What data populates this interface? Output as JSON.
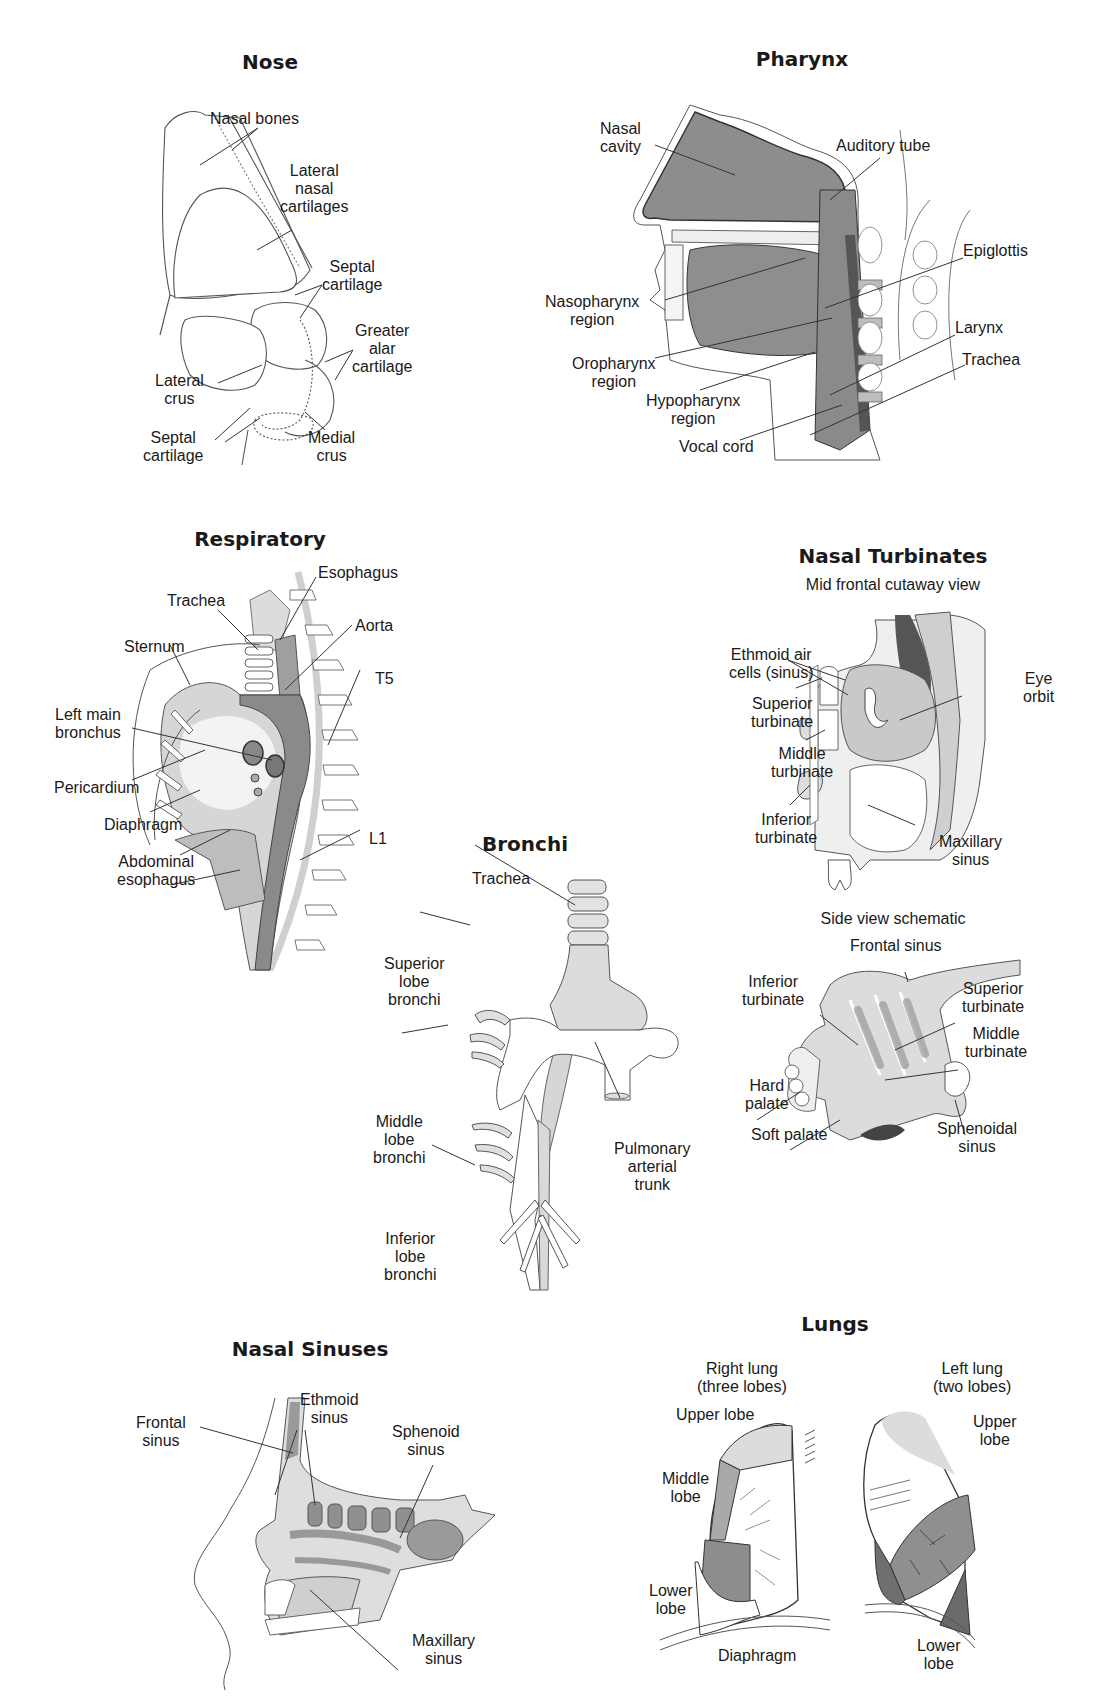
{
  "page": {
    "background": "#ffffff",
    "ink_color": "#1a1a1a",
    "tone_light": "#d8d8d8",
    "tone_mid": "#a9a9a9",
    "tone_dark": "#6f6f6f"
  },
  "panels": {
    "nose": {
      "title": "Nose",
      "labels": [
        {
          "text": "Nasal bones"
        },
        {
          "text": "Lateral\nnasal\ncartilages"
        },
        {
          "text": "Septal\ncartilage"
        },
        {
          "text": "Greater\nalar\ncartilage"
        },
        {
          "text": "Lateral\ncrus"
        },
        {
          "text": "Septal\ncartilage"
        },
        {
          "text": "Medial\ncrus"
        }
      ]
    },
    "pharynx": {
      "title": "Pharynx",
      "labels": [
        {
          "text": "Nasal\ncavity"
        },
        {
          "text": "Auditory tube"
        },
        {
          "text": "Epiglottis"
        },
        {
          "text": "Nasopharynx\nregion"
        },
        {
          "text": "Larynx"
        },
        {
          "text": "Oropharynx\nregion"
        },
        {
          "text": "Trachea"
        },
        {
          "text": "Hypopharynx\nregion"
        },
        {
          "text": "Vocal cord"
        }
      ]
    },
    "respiratory": {
      "title": "Respiratory",
      "labels": [
        {
          "text": "Esophagus"
        },
        {
          "text": "Trachea"
        },
        {
          "text": "Aorta"
        },
        {
          "text": "Sternum"
        },
        {
          "text": "T5"
        },
        {
          "text": "Left main\nbronchus"
        },
        {
          "text": "Pericardium"
        },
        {
          "text": "Diaphragm"
        },
        {
          "text": "Abdominal\nesophagus"
        },
        {
          "text": "L1"
        }
      ]
    },
    "nasal_turbinates": {
      "title": "Nasal Turbinates",
      "front_view": {
        "subtitle": "Mid frontal cutaway view",
        "labels": [
          {
            "text": "Ethmoid air\ncells (sinus)"
          },
          {
            "text": "Eye\norbit"
          },
          {
            "text": "Superior\nturbinate"
          },
          {
            "text": "Middle\nturbinate"
          },
          {
            "text": "Inferior\nturbinate"
          },
          {
            "text": "Maxillary\nsinus"
          }
        ]
      },
      "side_view": {
        "subtitle": "Side view schematic",
        "labels": [
          {
            "text": "Frontal sinus"
          },
          {
            "text": "Inferior\nturbinate"
          },
          {
            "text": "Superior\nturbinate"
          },
          {
            "text": "Middle\nturbinate"
          },
          {
            "text": "Hard\npalate"
          },
          {
            "text": "Soft palate"
          },
          {
            "text": "Sphenoidal\nsinus"
          }
        ]
      }
    },
    "bronchi": {
      "title": "Bronchi",
      "labels": [
        {
          "text": "Trachea"
        },
        {
          "text": "Superior\nlobe\nbronchi"
        },
        {
          "text": "Middle\nlobe\nbronchi"
        },
        {
          "text": "Pulmonary\narterial\ntrunk"
        },
        {
          "text": "Inferior\nlobe\nbronchi"
        }
      ]
    },
    "nasal_sinuses": {
      "title": "Nasal Sinuses",
      "labels": [
        {
          "text": "Frontal\nsinus"
        },
        {
          "text": "Ethmoid\nsinus"
        },
        {
          "text": "Sphenoid\nsinus"
        },
        {
          "text": "Maxillary\nsinus"
        }
      ]
    },
    "lungs": {
      "title": "Lungs",
      "labels": [
        {
          "text": "Right lung\n(three lobes)"
        },
        {
          "text": "Left lung\n(two lobes)"
        },
        {
          "text": "Upper lobe"
        },
        {
          "text": "Upper\nlobe"
        },
        {
          "text": "Middle\nlobe"
        },
        {
          "text": "Lower\nlobe"
        },
        {
          "text": "Diaphragm"
        },
        {
          "text": "Lower\nlobe"
        }
      ]
    }
  }
}
